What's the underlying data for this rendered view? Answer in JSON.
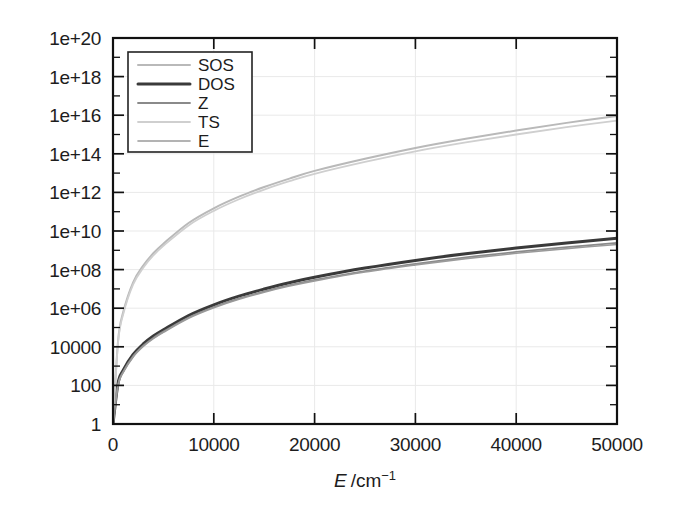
{
  "chart_data": {
    "type": "line",
    "title": "",
    "xlabel": "E /cm−1",
    "xlabel_parts": {
      "symbol": "E",
      "unit": "/cm",
      "exponent": "−1"
    },
    "ylabel": "",
    "xlim": [
      0,
      50000
    ],
    "ylim": [
      1,
      1e+20
    ],
    "yscale": "log",
    "xscale": "linear",
    "grid": true,
    "legend_position": "upper-left-inside",
    "xticks": [
      0,
      10000,
      20000,
      30000,
      40000,
      50000
    ],
    "xtick_labels": [
      "0",
      "10000",
      "20000",
      "30000",
      "40000",
      "50000"
    ],
    "yticks": [
      1,
      100,
      10000,
      1000000.0,
      100000000.0,
      10000000000.0,
      1000000000000.0,
      100000000000000.0,
      1e+16,
      1e+18,
      1e+20
    ],
    "ytick_labels": [
      "1",
      "100",
      "10000",
      "1e+06",
      "1e+08",
      "1e+10",
      "1e+12",
      "1e+14",
      "1e+16",
      "1e+18",
      "1e+20"
    ],
    "x": [
      0,
      500,
      1000,
      2000,
      3000,
      4000,
      5000,
      7500,
      10000,
      12500,
      15000,
      17500,
      20000,
      25000,
      30000,
      35000,
      40000,
      45000,
      50000
    ],
    "series": [
      {
        "name": "SOS",
        "color": "#b9b9b9",
        "width": 2.0,
        "values": [
          1.0,
          20000.0,
          600000.0,
          22000000.0,
          160000000.0,
          700000000.0,
          2200000000.0,
          26000000000.0,
          150000000000.0,
          600000000000.0,
          1900000000000.0,
          5200000000000.0,
          13000000000000.0,
          55000000000000.0,
          200000000000000.0,
          600000000000000.0,
          1600000000000000.0,
          4000000000000000.0,
          9000000000000000.0
        ]
      },
      {
        "name": "DOS",
        "color": "#3a3a3a",
        "width": 3.0,
        "values": [
          1.0,
          130.0,
          600.0,
          4000.0,
          14000.0,
          36000.0,
          76000.0,
          420000.0,
          1500000.0,
          4200000.0,
          9800000.0,
          21000000.0,
          40000000.0,
          120000000.0,
          300000000.0,
          660000000.0,
          1300000000.0,
          2400000000.0,
          4200000000.0
        ]
      },
      {
        "name": "Z",
        "color": "#8a8a8a",
        "width": 1.8,
        "values": [
          1.0,
          110.0,
          500.0,
          3300.0,
          11500.0,
          29000.0,
          61000.0,
          330000.0,
          1150000.0,
          3200000.0,
          7400000.0,
          15500000.0,
          29000000.0,
          84000000.0,
          200000000.0,
          430000000.0,
          820000000.0,
          1450000000.0,
          2400000000.0
        ]
      },
      {
        "name": "TS",
        "color": "#cfcfcf",
        "width": 1.8,
        "values": [
          1.0,
          16000.0,
          460000.0,
          17000000.0,
          125000000.0,
          540000000.0,
          1700000000.0,
          19500000000.0,
          110000000000.0,
          440000000000.0,
          1400000000000.0,
          3800000000000.0,
          9200000000000.0,
          38000000000000.0,
          135000000000000.0,
          390000000000000.0,
          1000000000000000.0,
          2400000000000000.0,
          5200000000000000.0
        ]
      },
      {
        "name": "E",
        "color": "#9a9a9a",
        "width": 1.6,
        "values": [
          1.0,
          100.0,
          460.0,
          3000.0,
          10500.0,
          26500.0,
          56000.0,
          300000.0,
          1050000.0,
          2900000.0,
          6700000.0,
          14000000.0,
          26000000.0,
          75000000.0,
          175000000.0,
          370000000.0,
          700000000.0,
          1220000000.0,
          2000000000.0
        ]
      }
    ],
    "legend_entries": [
      {
        "label": "SOS",
        "color": "#b9b9b9",
        "width": 2.0
      },
      {
        "label": "DOS",
        "color": "#3a3a3a",
        "width": 3.0
      },
      {
        "label": "Z",
        "color": "#8a8a8a",
        "width": 1.8
      },
      {
        "label": "TS",
        "color": "#cfcfcf",
        "width": 1.8
      },
      {
        "label": "E",
        "color": "#9a9a9a",
        "width": 1.6
      }
    ]
  },
  "figure": {
    "background": "#ffffff",
    "frame_color": "#111111"
  }
}
